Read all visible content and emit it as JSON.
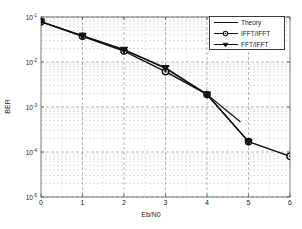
{
  "chart_data": {
    "type": "line",
    "title": "",
    "xlabel": "Eb/N0",
    "ylabel": "BER",
    "xlim": [
      0,
      6
    ],
    "ylim": [
      1e-05,
      0.1
    ],
    "yscale": "log",
    "grid": true,
    "grid_style": "dashed",
    "legend_position": "upper right",
    "xticks": [
      "0",
      "1",
      "2",
      "3",
      "4",
      "5",
      "6"
    ],
    "xtick_values": [
      0,
      1,
      2,
      3,
      4,
      5,
      6
    ],
    "yticks": [
      "10-1",
      "10-2",
      "10-3",
      "10-4",
      "10-5"
    ],
    "ytick_values": [
      0.1,
      0.01,
      0.001,
      0.0001,
      1e-05
    ],
    "ytick_mantissa": [
      "10",
      "10",
      "10",
      "10",
      "10"
    ],
    "ytick_exponent": [
      "-1",
      "-2",
      "-3",
      "-4",
      "-5"
    ],
    "series": [
      {
        "name": "Theory",
        "marker": "none",
        "color": "#111111",
        "x": [
          0,
          1,
          2,
          3,
          4,
          4.8
        ],
        "values": [
          0.0785,
          0.0375,
          0.0186,
          0.0072,
          0.0019,
          0.00047
        ]
      },
      {
        "name": "IFFT/IFFT",
        "marker": "circle",
        "color": "#111111",
        "x": [
          0,
          1,
          2,
          3,
          4,
          5,
          6
        ],
        "values": [
          0.078,
          0.0372,
          0.0175,
          0.0061,
          0.0019,
          0.00017,
          8e-05
        ]
      },
      {
        "name": "FFT/IFFT",
        "marker": "triangle-down",
        "color": "#111111",
        "x": [
          0,
          1,
          2,
          3,
          4,
          5
        ],
        "values": [
          0.079,
          0.0385,
          0.0188,
          0.0074,
          0.0019,
          0.00017
        ]
      }
    ]
  },
  "legend": {
    "entries": [
      {
        "label": "Theory",
        "marker": "none"
      },
      {
        "label": "IFFT/IFFT",
        "marker": "circle"
      },
      {
        "label": "FFT/IFFT",
        "marker": "triangle-down"
      }
    ]
  },
  "axes": {
    "xlabel": "Eb/N0",
    "ylabel": "BER"
  }
}
